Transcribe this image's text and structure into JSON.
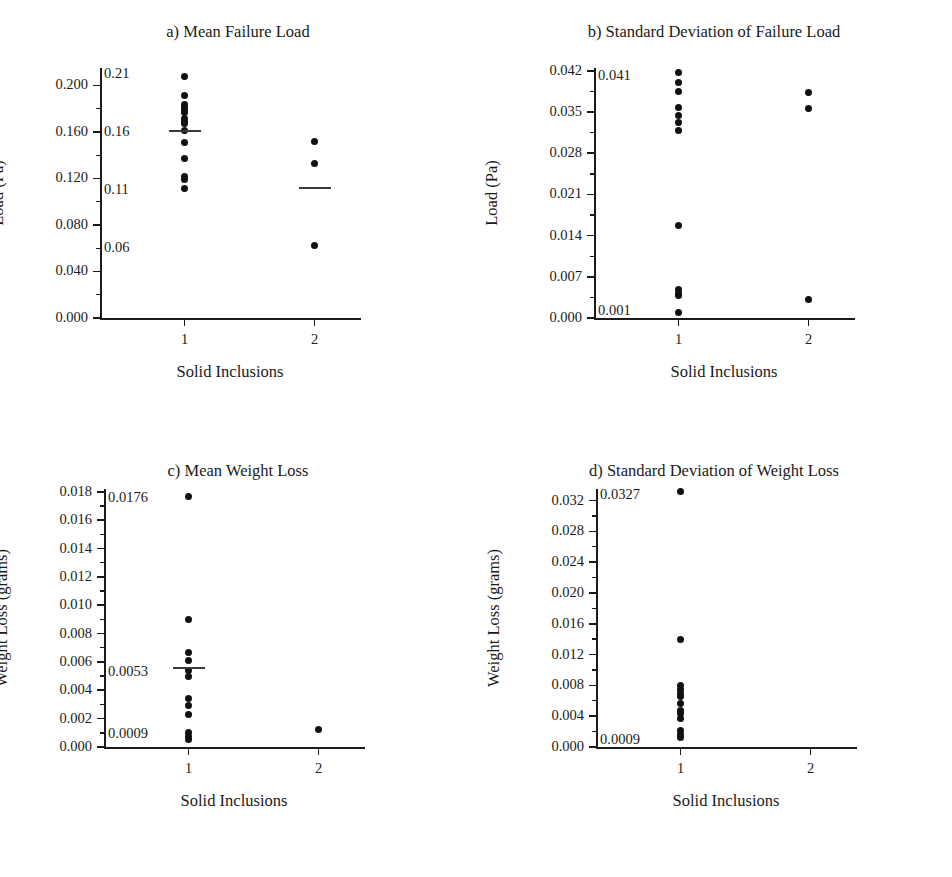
{
  "figure": {
    "background": "#ffffff",
    "dot_color": "#111111",
    "axis_color": "#1a1a1a"
  },
  "shared": {
    "xlabel": "Solid Inclusions",
    "xticks": [
      "1",
      "2"
    ]
  },
  "chart_data": [
    {
      "id": "a",
      "type": "scatter",
      "title": "a) Mean Failure Load",
      "xlabel": "Solid Inclusions",
      "ylabel": "Load (Pa)",
      "categories": [
        "1",
        "2"
      ],
      "xlim": [
        0.35,
        2.35
      ],
      "ylim": [
        0.0,
        0.215
      ],
      "yticks": [
        "0.000",
        "0.040",
        "0.080",
        "0.120",
        "0.160",
        "0.200"
      ],
      "ytick_values": [
        0.0,
        0.04,
        0.08,
        0.12,
        0.16,
        0.2
      ],
      "minor_ticks": true,
      "grid": false,
      "legend": "none",
      "inner_annotations": [
        {
          "label": "0.21",
          "value": 0.21
        },
        {
          "label": "0.16",
          "value": 0.16
        },
        {
          "label": "0.11",
          "value": 0.11
        },
        {
          "label": "0.06",
          "value": 0.06
        }
      ],
      "series": [
        {
          "name": "1",
          "x": 1,
          "mean": 0.161,
          "values": [
            0.208,
            0.191,
            0.184,
            0.181,
            0.179,
            0.177,
            0.172,
            0.169,
            0.167,
            0.161,
            0.151,
            0.137,
            0.122,
            0.119,
            0.111
          ]
        },
        {
          "name": "2",
          "x": 2,
          "mean": 0.112,
          "values": [
            0.152,
            0.133,
            0.062
          ]
        }
      ]
    },
    {
      "id": "b",
      "type": "scatter",
      "title": "b) Standard Deviation of Failure Load",
      "xlabel": "Solid Inclusions",
      "ylabel": "Load (Pa)",
      "categories": [
        "1",
        "2"
      ],
      "xlim": [
        0.35,
        2.35
      ],
      "ylim": [
        0.0,
        0.0425
      ],
      "yticks": [
        "0.000",
        "0.007",
        "0.014",
        "0.021",
        "0.028",
        "0.035",
        "0.042"
      ],
      "ytick_values": [
        0.0,
        0.007,
        0.014,
        0.021,
        0.028,
        0.035,
        0.042
      ],
      "minor_ticks": true,
      "grid": false,
      "legend": "none",
      "inner_annotations": [
        {
          "label": "0.041",
          "value": 0.0412
        },
        {
          "label": "0.001",
          "value": 0.0012
        }
      ],
      "series": [
        {
          "name": "1",
          "x": 1,
          "mean": null,
          "values": [
            0.0418,
            0.04,
            0.0385,
            0.0358,
            0.0345,
            0.0333,
            0.0319,
            0.0157,
            0.0048,
            0.0042,
            0.0038,
            0.001
          ]
        },
        {
          "name": "2",
          "x": 2,
          "mean": null,
          "values": [
            0.0383,
            0.0357,
            0.0031
          ]
        }
      ]
    },
    {
      "id": "c",
      "type": "scatter",
      "title": "c) Mean Weight Loss",
      "xlabel": "Solid Inclusions",
      "ylabel": "Weight Loss (grams)",
      "categories": [
        "1",
        "2"
      ],
      "xlim": [
        0.35,
        2.35
      ],
      "ylim": [
        0.0,
        0.0182
      ],
      "yticks": [
        "0.000",
        "0.002",
        "0.004",
        "0.006",
        "0.008",
        "0.010",
        "0.012",
        "0.014",
        "0.016",
        "0.018"
      ],
      "ytick_values": [
        0.0,
        0.002,
        0.004,
        0.006,
        0.008,
        0.01,
        0.012,
        0.014,
        0.016,
        0.018
      ],
      "minor_ticks": true,
      "grid": false,
      "legend": "none",
      "inner_annotations": [
        {
          "label": "0.0176",
          "value": 0.0176
        },
        {
          "label": "0.0053",
          "value": 0.0053
        },
        {
          "label": "0.0009",
          "value": 0.0009
        }
      ],
      "series": [
        {
          "name": "1",
          "x": 1,
          "mean": 0.00555,
          "values": [
            0.01765,
            0.009,
            0.0067,
            0.0061,
            0.0054,
            0.005,
            0.0034,
            0.0029,
            0.0023,
            0.001,
            0.00075,
            0.00055
          ]
        },
        {
          "name": "2",
          "x": 2,
          "mean": null,
          "values": [
            0.0012
          ]
        }
      ]
    },
    {
      "id": "d",
      "type": "scatter",
      "title": "d) Standard Deviation of Weight Loss",
      "xlabel": "Solid Inclusions",
      "ylabel": "Weight Loss (grams)",
      "categories": [
        "1",
        "2"
      ],
      "xlim": [
        0.35,
        2.35
      ],
      "ylim": [
        0.0,
        0.0335
      ],
      "yticks": [
        "0.000",
        "0.004",
        "0.008",
        "0.012",
        "0.016",
        "0.020",
        "0.024",
        "0.028",
        "0.032"
      ],
      "ytick_values": [
        0.0,
        0.004,
        0.008,
        0.012,
        0.016,
        0.02,
        0.024,
        0.028,
        0.032
      ],
      "minor_ticks": true,
      "grid": false,
      "legend": "none",
      "inner_annotations": [
        {
          "label": "0.0327",
          "value": 0.0327
        },
        {
          "label": "0.0009",
          "value": 0.0009
        }
      ],
      "series": [
        {
          "name": "1",
          "x": 1,
          "mean": null,
          "values": [
            0.0332,
            0.0139,
            0.008,
            0.0075,
            0.007,
            0.0065,
            0.0057,
            0.0048,
            0.0043,
            0.0037,
            0.0021,
            0.0016,
            0.0012
          ]
        },
        {
          "name": "2",
          "x": 2,
          "mean": null,
          "values": []
        }
      ]
    }
  ]
}
